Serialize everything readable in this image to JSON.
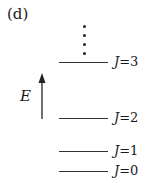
{
  "panel_label": "(d)",
  "axis": {
    "label": "E",
    "direction": "up"
  },
  "levels": [
    {
      "j_symbol": "J",
      "eq": "=3",
      "y": 62
    },
    {
      "j_symbol": "J",
      "eq": "=2",
      "y": 118
    },
    {
      "j_symbol": "J",
      "eq": "=1",
      "y": 151
    },
    {
      "j_symbol": "J",
      "eq": "=0",
      "y": 171
    }
  ],
  "continuation": "vertical-ellipsis",
  "colors": {
    "ink": "#1a1a1a",
    "background": "#ffffff"
  }
}
